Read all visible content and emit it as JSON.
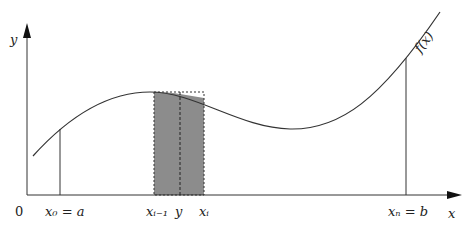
{
  "diagram": {
    "function_label": "f(x)",
    "axes": {
      "x_label": "x",
      "y_label": "y",
      "origin_label": "0"
    },
    "x_ticks": [
      {
        "id": "x0",
        "label": "x₀ = a"
      },
      {
        "id": "xi-1",
        "label": "xᵢ₋₁"
      },
      {
        "id": "y",
        "label": "y"
      },
      {
        "id": "xi",
        "label": "xᵢ"
      },
      {
        "id": "xn",
        "label": "xₙ = b"
      }
    ],
    "rectangle": {
      "fill": "#8c8c8c",
      "style": "shaded rectangle with dashed outline"
    },
    "colors": {
      "line": "#333333",
      "fill": "#8c8c8c"
    }
  }
}
